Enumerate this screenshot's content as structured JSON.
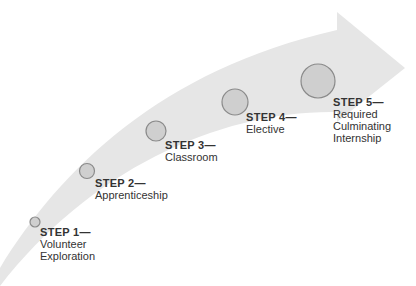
{
  "diagram": {
    "type": "curved-arrow-progression",
    "colors": {
      "arrow_fill": "#e6e6e6",
      "circle_fill": "#cfcfcf",
      "circle_stroke": "#8a8a8a",
      "text": "#333333"
    },
    "steps": [
      {
        "title": "STEP 1—",
        "lines": [
          "Volunteer",
          "Exploration"
        ]
      },
      {
        "title": "STEP 2—",
        "lines": [
          "Apprenticeship"
        ]
      },
      {
        "title": "STEP 3—",
        "lines": [
          "Classroom"
        ]
      },
      {
        "title": "STEP 4—",
        "lines": [
          "Elective"
        ]
      },
      {
        "title": "STEP 5—",
        "lines": [
          "Required",
          "Culminating",
          "Internship"
        ]
      }
    ]
  }
}
